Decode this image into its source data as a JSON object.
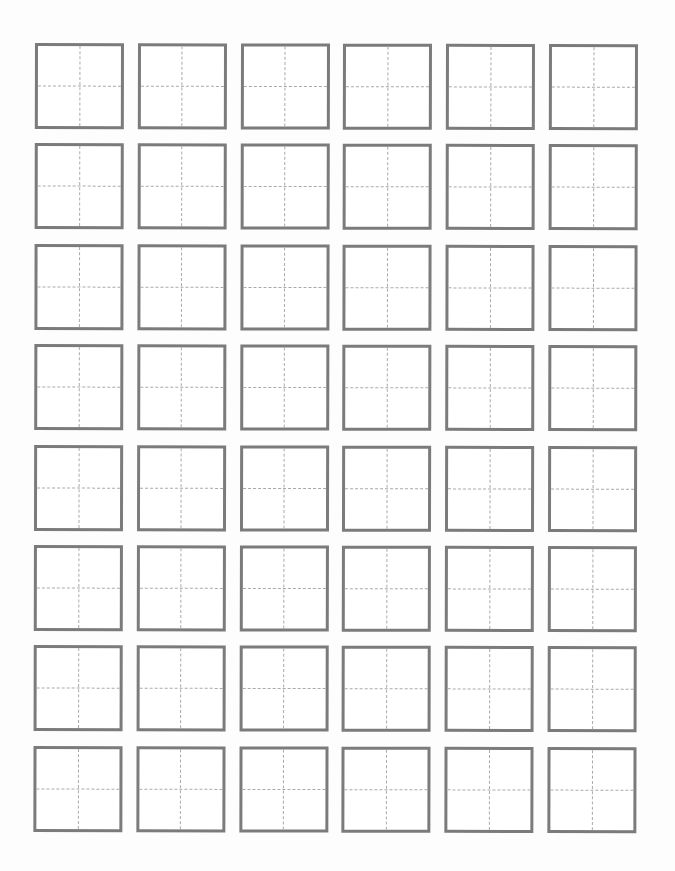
{
  "worksheet": {
    "type": "tianzige-practice-grid",
    "rows": 8,
    "columns": 6,
    "cell_count": 48,
    "cells_filled": 0,
    "colors": {
      "background": "#fdfdfd",
      "box_border": "#7b7b7b",
      "guide_lines": "#a9a9a9"
    }
  }
}
